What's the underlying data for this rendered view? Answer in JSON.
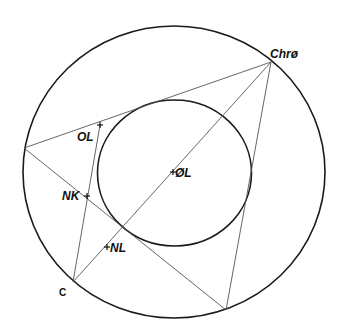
{
  "colors": {
    "stroke": "#1a1a1a",
    "thin": "#555555",
    "background": "#ffffff"
  },
  "outer_circle": {
    "cx": 174,
    "cy": 172,
    "rx": 151,
    "ry": 146
  },
  "inner_circle": {
    "cx": 174.5,
    "cy": 173,
    "rx": 77,
    "ry": 73
  },
  "vertices": {
    "chro": {
      "x": 271,
      "y": 62
    },
    "left": {
      "x": 24,
      "y": 148
    },
    "bottom": {
      "x": 226,
      "y": 310
    },
    "c": {
      "x": 73,
      "y": 282
    }
  },
  "points": {
    "ol": {
      "x": 100,
      "y": 125
    },
    "nk": {
      "x": 87,
      "y": 196
    },
    "nl": {
      "x": 106,
      "y": 247
    },
    "center": {
      "x": 172,
      "y": 172
    }
  },
  "labels": {
    "chro": "Chrø",
    "ol": "OL",
    "nk": "NK",
    "center": "ØL",
    "nl": "NL",
    "c": "C"
  }
}
